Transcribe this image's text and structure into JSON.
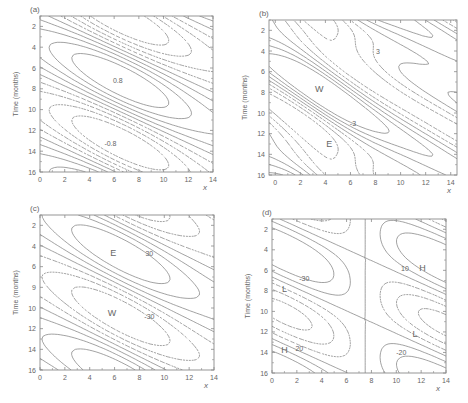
{
  "figure": {
    "width": 468,
    "height": 403,
    "line_color": "#7a7a7a",
    "axis_color": "#8a8a8a",
    "text_color": "#666666",
    "background": "#ffffff"
  },
  "chart_data": [
    {
      "type": "contour",
      "panel_label": "(a)",
      "xlabel": "x",
      "ylabel": "Time (months)",
      "xlim": [
        0,
        14
      ],
      "ylim": [
        16,
        1
      ],
      "xticks": [
        0,
        2,
        4,
        6,
        8,
        10,
        12,
        14
      ],
      "yticks": [
        2,
        4,
        6,
        8,
        10,
        12,
        14,
        16
      ],
      "ytick_labels": [
        "2",
        "4",
        "6",
        "8",
        "10",
        "12",
        "14",
        "16"
      ],
      "pixel_box": {
        "left": 40,
        "top": 16,
        "right": 213,
        "bottom": 172
      },
      "field": {
        "amp": 1.0,
        "y0": 7.2,
        "period": 12,
        "x0": 6.5,
        "xwidth": 5.5,
        "tilt": 0.55,
        "bias": 0.0,
        "wave2": 0.0
      },
      "levels": [
        -0.8,
        -0.6,
        -0.4,
        -0.2,
        0.0,
        0.2,
        0.4,
        0.6,
        0.8
      ],
      "annotations": [
        {
          "text": "0.8",
          "x": 6.3,
          "y": 7.2
        },
        {
          "text": "-0.8",
          "x": 5.7,
          "y": 13.2
        }
      ]
    },
    {
      "type": "contour",
      "panel_label": "(b)",
      "xlabel": "x",
      "ylabel": "Time (months)",
      "xlim": [
        -0.5,
        14.5
      ],
      "ylim": [
        16,
        1
      ],
      "xticks": [
        0,
        2,
        4,
        6,
        8,
        10,
        12,
        14
      ],
      "yticks": [
        2,
        4,
        6,
        8,
        10,
        12,
        14,
        16
      ],
      "ytick_labels": [
        "2",
        "4",
        "6",
        "8",
        "10",
        "12",
        "14",
        "16"
      ],
      "pixel_box": {
        "left": 269,
        "top": 20,
        "right": 457,
        "bottom": 175
      },
      "field": {
        "amp": 4.0,
        "y0": 7.5,
        "period": 11.5,
        "x0": 3.5,
        "xwidth": 4.5,
        "tilt": 0.9,
        "bias": 0.0,
        "wave2": 1.2
      },
      "levels": [
        -3,
        -2,
        -1,
        0,
        1,
        2,
        3
      ],
      "annotations": [
        {
          "text": "W",
          "x": 3.5,
          "y": 7.7
        },
        {
          "text": "E",
          "x": 4.3,
          "y": 13.0
        },
        {
          "text": "3",
          "x": 8.2,
          "y": 4.0
        },
        {
          "text": "-3",
          "x": 6.2,
          "y": 11.0
        }
      ]
    },
    {
      "type": "contour",
      "panel_label": "(c)",
      "xlabel": "x",
      "ylabel": "Time (months)",
      "xlim": [
        0,
        14
      ],
      "ylim": [
        16,
        1
      ],
      "xticks": [
        0,
        2,
        4,
        6,
        8,
        10,
        12,
        14
      ],
      "yticks": [
        2,
        4,
        6,
        8,
        10,
        12,
        14,
        16
      ],
      "ytick_labels": [
        "2",
        "4",
        "6",
        "9",
        "10",
        "12",
        "14",
        "16"
      ],
      "pixel_box": {
        "left": 40,
        "top": 215,
        "right": 214,
        "bottom": 370
      },
      "field": {
        "amp": 40.0,
        "y0": 4.8,
        "period": 12,
        "x0": 6.5,
        "xwidth": 5.0,
        "tilt": 0.6,
        "bias": 0.0,
        "wave2": 0.0
      },
      "levels": [
        -30,
        -20,
        -10,
        0,
        10,
        20,
        30
      ],
      "annotations": [
        {
          "text": "E",
          "x": 5.9,
          "y": 4.7
        },
        {
          "text": "30",
          "x": 8.8,
          "y": 4.7
        },
        {
          "text": "W",
          "x": 5.8,
          "y": 10.5
        },
        {
          "text": "-30",
          "x": 8.8,
          "y": 10.8
        }
      ]
    },
    {
      "type": "contour",
      "panel_label": "(d)",
      "xlabel": "x",
      "ylabel": "Time (months)",
      "xlim": [
        0,
        14
      ],
      "ylim": [
        16,
        1
      ],
      "xticks": [
        0,
        2,
        4,
        6,
        8,
        10,
        12,
        14
      ],
      "yticks": [
        2,
        4,
        6,
        8,
        10,
        12,
        14,
        16
      ],
      "ytick_labels": [
        "2",
        "4",
        "6",
        "8",
        "10",
        "12",
        "14",
        "16"
      ],
      "pixel_box": {
        "left": 272,
        "top": 219,
        "right": 446,
        "bottom": 373
      },
      "field": {
        "amp": 35.0,
        "y0": 1.5,
        "period": 12,
        "x0": 0.0,
        "xwidth": 14,
        "tilt": 1.0,
        "bias": 0.0,
        "wave2": 0.0,
        "dipole": true
      },
      "levels": [
        -30,
        -20,
        -10,
        0,
        10,
        20
      ],
      "annotations": [
        {
          "text": "L",
          "x": 1.0,
          "y": 7.8
        },
        {
          "text": "-30",
          "x": 2.6,
          "y": 6.7
        },
        {
          "text": "H",
          "x": 1.0,
          "y": 13.8
        },
        {
          "text": "20",
          "x": 2.2,
          "y": 13.6
        },
        {
          "text": "10",
          "x": 10.7,
          "y": 5.8
        },
        {
          "text": "H",
          "x": 12.1,
          "y": 5.8
        },
        {
          "text": "L",
          "x": 11.5,
          "y": 12.2
        },
        {
          "text": "-20",
          "x": 10.4,
          "y": 14.0
        }
      ]
    }
  ]
}
